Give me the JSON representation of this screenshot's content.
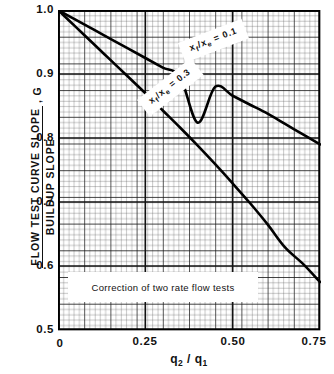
{
  "chart_data": {
    "type": "line",
    "title": "",
    "caption": "Correction of two rate flow tests",
    "xlabel_parts": {
      "main1": "q",
      "sub1": "2",
      "slash": " / ",
      "main2": "q",
      "sub2": "1"
    },
    "xlabel_text": "q2 / q1",
    "ylabel_numerator": "FLOW TEST CURVE SLOPE",
    "ylabel_denominator": "BUILDUP SLOPE",
    "ylabel_suffix": ", G",
    "xlim": [
      0,
      0.75
    ],
    "ylim": [
      0.5,
      1.0
    ],
    "xticks": [
      "0",
      "0.25",
      "0.50",
      "0.75"
    ],
    "xtick_values": [
      0,
      0.25,
      0.5,
      0.75
    ],
    "yticks": [
      "0.5",
      "0.6",
      "0.7",
      "0.8",
      "0.9",
      "1.0"
    ],
    "ytick_values": [
      0.5,
      0.6,
      0.7,
      0.8,
      0.9,
      1.0
    ],
    "grid": "engineering graph paper, minor divisions with heavier major lines every 5 minor cells",
    "legend_position": "inline labels on curves",
    "series": [
      {
        "name": "xf/xe = 0.1",
        "label_main": "x",
        "label_sub1": "f",
        "label_mid": "/x",
        "label_sub2": "e",
        "label_eq": " = 0.1",
        "x": [
          0,
          0.05,
          0.1,
          0.15,
          0.2,
          0.25,
          0.3,
          0.35,
          0.4,
          0.45,
          0.5,
          0.55,
          0.6,
          0.65,
          0.7,
          0.75
        ],
        "y": [
          1.0,
          0.985,
          0.97,
          0.955,
          0.94,
          0.925,
          0.91,
          0.895,
          0.824,
          0.88,
          0.866,
          0.852,
          0.838,
          0.822,
          0.806,
          0.79
        ]
      },
      {
        "name": "xf/xe = 0.3",
        "label_main": "x",
        "label_sub1": "f",
        "label_mid": "/x",
        "label_sub2": "e",
        "label_eq": " = 0.3",
        "x": [
          0,
          0.05,
          0.1,
          0.15,
          0.2,
          0.25,
          0.3,
          0.35,
          0.4,
          0.45,
          0.5,
          0.55,
          0.6,
          0.65,
          0.7,
          0.75
        ],
        "y": [
          1.0,
          0.974,
          0.948,
          0.922,
          0.896,
          0.87,
          0.843,
          0.816,
          0.788,
          0.759,
          0.729,
          0.698,
          0.665,
          0.629,
          0.604,
          0.575
        ]
      }
    ]
  }
}
